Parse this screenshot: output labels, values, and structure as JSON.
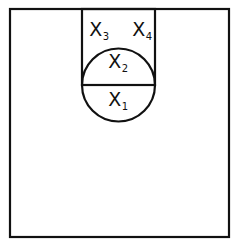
{
  "diagram": {
    "stroke_color": "#111111",
    "background_color": "#ffffff",
    "outer_square": {
      "x": 10,
      "y": 9,
      "width": 219,
      "height": 228
    },
    "inner_rectangle": {
      "x": 82,
      "y": 9,
      "width": 73,
      "height": 76
    },
    "circle": {
      "cx": 118.5,
      "cy": 85,
      "r": 36.5
    },
    "diameter_line": {
      "x1": 82,
      "y1": 85,
      "x2": 155,
      "y2": 85
    },
    "labels": [
      {
        "id": "x1",
        "base": "X",
        "sub": "1",
        "x": 118,
        "y": 101
      },
      {
        "id": "x2",
        "base": "X",
        "sub": "2",
        "x": 118,
        "y": 63
      },
      {
        "id": "x3",
        "base": "X",
        "sub": "3",
        "x": 99,
        "y": 31
      },
      {
        "id": "x4",
        "base": "X",
        "sub": "4",
        "x": 142,
        "y": 31
      }
    ]
  }
}
